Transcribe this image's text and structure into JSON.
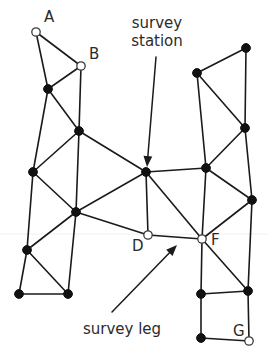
{
  "figure": {
    "background_color": "#ffffff",
    "line_color": "#1a1a1a",
    "filled_station_color": "#111111",
    "open_station_fill": "#ffffff",
    "open_station_stroke": "#3a3a3a",
    "text_color": "#2b2b2b"
  },
  "callouts": {
    "station": {
      "line1": "survey",
      "line2": "station",
      "text_x": 157,
      "text_y1": 28,
      "text_y2": 46,
      "arrow_from_x": 156,
      "arrow_from_y": 57,
      "arrow_to_x": 147,
      "arrow_to_y": 167,
      "target_label": "unlabelled central station"
    },
    "leg": {
      "line1": "survey leg",
      "text_x": 122,
      "text_y": 334,
      "arrow_from_x": 112,
      "arrow_from_y": 312,
      "arrow_to_x": 177,
      "arrow_to_y": 245,
      "target_label": "leg between D and F"
    }
  },
  "stations": [
    {
      "id": "A",
      "label": "A",
      "x": 36,
      "y": 32,
      "type": "open",
      "label_x": 44,
      "label_y": 22
    },
    {
      "id": "B",
      "label": "B",
      "x": 81,
      "y": 66,
      "type": "open",
      "label_x": 89,
      "label_y": 59
    },
    {
      "id": "D",
      "label": "D",
      "x": 148,
      "y": 235,
      "type": "open",
      "label_x": 132,
      "label_y": 251
    },
    {
      "id": "F",
      "label": "F",
      "x": 202,
      "y": 239,
      "type": "open",
      "label_x": 211,
      "label_y": 245
    },
    {
      "id": "G",
      "label": "G",
      "x": 249,
      "y": 341,
      "type": "open",
      "label_x": 233,
      "label_y": 336
    },
    {
      "id": "n1",
      "label": "",
      "x": 48,
      "y": 89,
      "type": "filled"
    },
    {
      "id": "n2",
      "label": "",
      "x": 79,
      "y": 131,
      "type": "filled"
    },
    {
      "id": "n3",
      "label": "",
      "x": 33,
      "y": 172,
      "type": "filled"
    },
    {
      "id": "n4",
      "label": "",
      "x": 76,
      "y": 212,
      "type": "filled"
    },
    {
      "id": "n5",
      "label": "",
      "x": 27,
      "y": 250,
      "type": "filled"
    },
    {
      "id": "n6",
      "label": "",
      "x": 19,
      "y": 294,
      "type": "filled"
    },
    {
      "id": "n7",
      "label": "",
      "x": 68,
      "y": 294,
      "type": "filled"
    },
    {
      "id": "c1",
      "label": "",
      "x": 146,
      "y": 172,
      "type": "filled"
    },
    {
      "id": "r1",
      "label": "",
      "x": 246,
      "y": 48,
      "type": "filled"
    },
    {
      "id": "r2",
      "label": "",
      "x": 197,
      "y": 73,
      "type": "filled"
    },
    {
      "id": "r3",
      "label": "",
      "x": 245,
      "y": 128,
      "type": "filled"
    },
    {
      "id": "r4",
      "label": "",
      "x": 206,
      "y": 168,
      "type": "filled"
    },
    {
      "id": "r5",
      "label": "",
      "x": 252,
      "y": 200,
      "type": "filled"
    },
    {
      "id": "r6",
      "label": "",
      "x": 248,
      "y": 291,
      "type": "filled"
    },
    {
      "id": "r7",
      "label": "",
      "x": 201,
      "y": 294,
      "type": "filled"
    },
    {
      "id": "r8",
      "label": "",
      "x": 201,
      "y": 338,
      "type": "filled"
    }
  ],
  "legs": [
    {
      "from": "A",
      "to": "B"
    },
    {
      "from": "A",
      "to": "n1"
    },
    {
      "from": "B",
      "to": "n1"
    },
    {
      "from": "B",
      "to": "n2"
    },
    {
      "from": "n1",
      "to": "n2"
    },
    {
      "from": "n1",
      "to": "n3"
    },
    {
      "from": "n2",
      "to": "n3"
    },
    {
      "from": "n2",
      "to": "n4"
    },
    {
      "from": "n2",
      "to": "c1"
    },
    {
      "from": "n3",
      "to": "n4"
    },
    {
      "from": "n3",
      "to": "n5"
    },
    {
      "from": "n4",
      "to": "n5"
    },
    {
      "from": "n4",
      "to": "n7"
    },
    {
      "from": "n4",
      "to": "c1"
    },
    {
      "from": "n4",
      "to": "D"
    },
    {
      "from": "n5",
      "to": "n6"
    },
    {
      "from": "n5",
      "to": "n7"
    },
    {
      "from": "n6",
      "to": "n7"
    },
    {
      "from": "c1",
      "to": "D"
    },
    {
      "from": "c1",
      "to": "F"
    },
    {
      "from": "c1",
      "to": "r4"
    },
    {
      "from": "D",
      "to": "F"
    },
    {
      "from": "r1",
      "to": "r2"
    },
    {
      "from": "r1",
      "to": "r3"
    },
    {
      "from": "r2",
      "to": "r3"
    },
    {
      "from": "r2",
      "to": "r4"
    },
    {
      "from": "r3",
      "to": "r4"
    },
    {
      "from": "r3",
      "to": "r5"
    },
    {
      "from": "r4",
      "to": "r5"
    },
    {
      "from": "r4",
      "to": "F"
    },
    {
      "from": "r5",
      "to": "F"
    },
    {
      "from": "r5",
      "to": "r6"
    },
    {
      "from": "F",
      "to": "r6"
    },
    {
      "from": "F",
      "to": "r7"
    },
    {
      "from": "r6",
      "to": "r7"
    },
    {
      "from": "r6",
      "to": "G"
    },
    {
      "from": "r7",
      "to": "r8"
    },
    {
      "from": "r8",
      "to": "G"
    }
  ]
}
